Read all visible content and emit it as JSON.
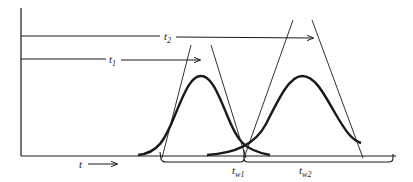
{
  "diagram": {
    "colors": {
      "line": "#1a1a1a",
      "background": "#ffffff"
    },
    "labels": {
      "t2": {
        "base": "t",
        "sub": "2"
      },
      "t1": {
        "base": "t",
        "sub": "1"
      },
      "tw1": {
        "base": "t",
        "sub": "w1"
      },
      "tw2": {
        "base": "t",
        "sub": "w2"
      },
      "time_axis": "t"
    },
    "peaks": [
      {
        "name": "peak-1",
        "retention_label": "t1",
        "width_label": "tw1"
      },
      {
        "name": "peak-2",
        "retention_label": "t2",
        "width_label": "tw2"
      }
    ]
  }
}
